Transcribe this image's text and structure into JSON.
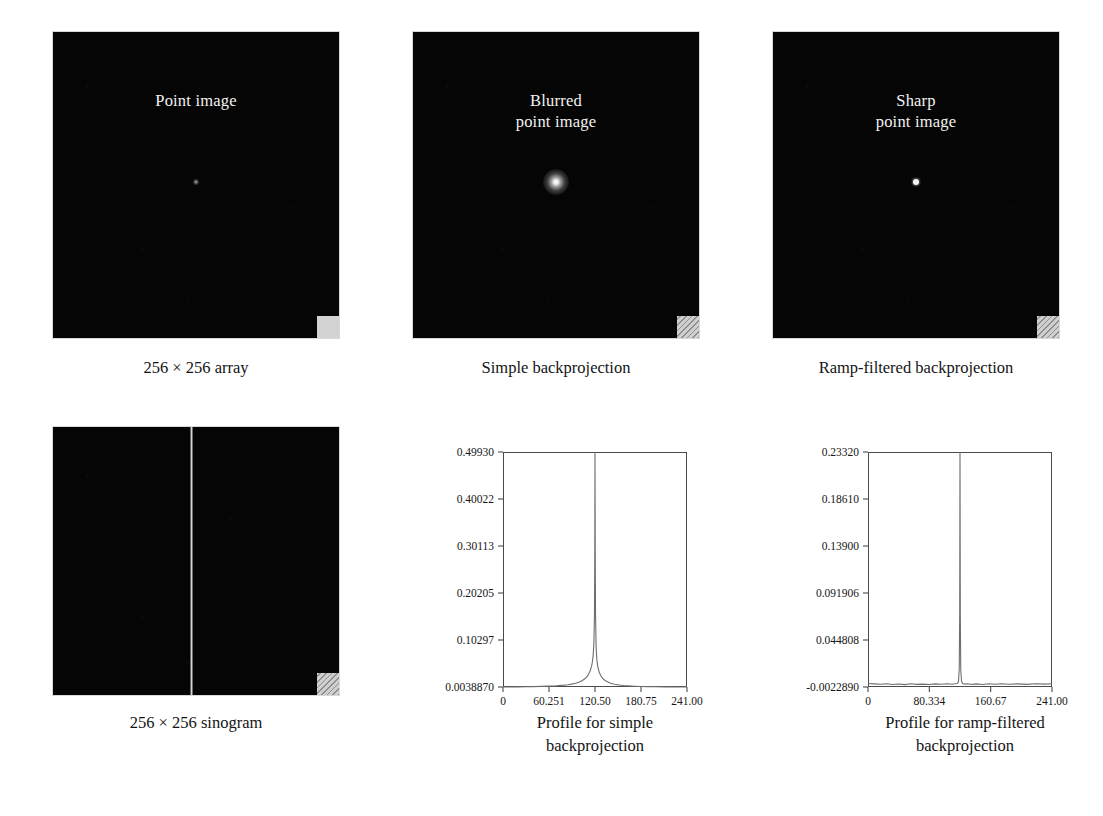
{
  "figure": {
    "panels": [
      {
        "id": "point-image",
        "overlay_title": "Point image",
        "caption": "256 × 256 array",
        "corner_marker": "solid-gray-square",
        "spot": "faint-point"
      },
      {
        "id": "blurred-point-image",
        "overlay_title": "Blurred\npoint image",
        "overlay_line1": "Blurred",
        "overlay_line2": "point image",
        "caption": "Simple backprojection",
        "corner_marker": "hatched-square",
        "spot": "blurred-point"
      },
      {
        "id": "sharp-point-image",
        "overlay_title": "Sharp\npoint image",
        "overlay_line1": "Sharp",
        "overlay_line2": "point image",
        "caption": "Ramp-filtered backprojection",
        "corner_marker": "hatched-square",
        "spot": "sharp-point"
      },
      {
        "id": "sinogram",
        "overlay_title": "",
        "caption": "256 × 256 sinogram",
        "corner_marker": "hatched-square",
        "spot": "vertical-line"
      }
    ],
    "captions": {
      "bottom_left": "256 × 256 sinogram",
      "bottom_middle_line1": "Profile for simple",
      "bottom_middle_line2": "backprojection",
      "bottom_right_line1": "Profile for ramp-filtered",
      "bottom_right_line2": "backprojection"
    },
    "colors": {
      "panel_background": "#050505",
      "overlay_text": "#f2f2f2",
      "plot_line": "#6e6e6e",
      "frame": "#4a4a4a",
      "page_background": "#ffffff",
      "corner_marker": "#d2d2d2"
    }
  },
  "chart_data": [
    {
      "id": "profile-simple-backprojection",
      "type": "line",
      "title": "Profile for simple backprojection",
      "title_line1": "Profile for simple",
      "title_line2": "backprojection",
      "xlabel": "",
      "ylabel": "",
      "xlim": [
        0,
        241.0
      ],
      "ylim": [
        0.003887,
        0.4993
      ],
      "grid": false,
      "legend": "none",
      "xticks": [
        0,
        60.251,
        120.5,
        180.75,
        241.0
      ],
      "xticklabels": [
        "0",
        "60.251",
        "120.50",
        "180.75",
        "241.00"
      ],
      "yticks": [
        0.003887,
        0.10297,
        0.20205,
        0.30113,
        0.40022,
        0.4993
      ],
      "yticklabels": [
        "0.0038870",
        "0.10297",
        "0.20205",
        "0.30113",
        "0.40022",
        "0.49930"
      ],
      "peak_center": 120.5,
      "peak_value": 0.4993,
      "baseline": 0.003887,
      "description": "Sharp central spike with broad 1/r tails typical of unfiltered backprojection blur",
      "x": [
        0,
        10,
        20,
        30,
        40,
        50,
        60,
        70,
        80,
        85,
        90,
        95,
        100,
        104,
        108,
        111,
        114,
        116,
        117,
        118,
        119,
        119.8,
        120.2,
        120.5,
        120.8,
        121.2,
        122,
        123,
        124,
        126,
        129,
        132,
        136,
        141,
        146,
        152,
        158,
        165,
        172,
        180,
        190,
        200,
        212,
        225,
        235,
        241
      ],
      "y": [
        0.0039,
        0.004,
        0.0042,
        0.0044,
        0.0047,
        0.0051,
        0.0057,
        0.0065,
        0.0078,
        0.0087,
        0.01,
        0.0118,
        0.0145,
        0.0175,
        0.0222,
        0.0278,
        0.0372,
        0.0478,
        0.056,
        0.069,
        0.094,
        0.156,
        0.288,
        0.4993,
        0.29,
        0.157,
        0.086,
        0.061,
        0.048,
        0.035,
        0.0252,
        0.0196,
        0.0152,
        0.0118,
        0.0098,
        0.0082,
        0.0071,
        0.0062,
        0.0056,
        0.005,
        0.0046,
        0.0043,
        0.0041,
        0.004,
        0.0039,
        0.0039
      ]
    },
    {
      "id": "profile-ramp-filtered-backprojection",
      "type": "line",
      "title": "Profile for ramp-filtered backprojection",
      "title_line1": "Profile for ramp-filtered",
      "title_line2": "backprojection",
      "xlabel": "",
      "ylabel": "",
      "xlim": [
        0,
        241.0
      ],
      "ylim": [
        -0.002289,
        0.2332
      ],
      "grid": false,
      "legend": "none",
      "xticks": [
        0,
        80.334,
        160.67,
        241.0
      ],
      "xticklabels": [
        "0",
        "80.334",
        "160.67",
        "241.00"
      ],
      "yticks": [
        -0.002289,
        0.044808,
        0.091906,
        0.139,
        0.1861,
        0.2332
      ],
      "yticklabels": [
        "-0.0022890",
        "0.044808",
        "0.091906",
        "0.13900",
        "0.18610",
        "0.23320"
      ],
      "peak_center": 120.5,
      "peak_value": 0.2332,
      "baseline": -0.002289,
      "description": "Very narrow impulse at center on a nearly flat noisy baseline",
      "x": [
        0,
        8,
        16,
        24,
        32,
        40,
        48,
        56,
        64,
        72,
        80,
        88,
        96,
        104,
        110,
        114,
        117,
        118.5,
        119.5,
        120.1,
        120.5,
        120.9,
        121.5,
        122.5,
        124,
        127,
        131,
        136,
        142,
        150,
        158,
        166,
        175,
        185,
        196,
        208,
        220,
        232,
        241
      ],
      "y": [
        0.0012,
        0.0008,
        0.0004,
        0.001,
        0.0002,
        0.0007,
        0.0001,
        0.0009,
        0.0003,
        0.0006,
        0.0002,
        0.0008,
        0.0004,
        0.001,
        0.0005,
        0.0009,
        0.0012,
        0.003,
        0.016,
        0.07,
        0.2332,
        0.069,
        0.015,
        0.0035,
        0.0012,
        0.0006,
        0.001,
        0.0003,
        0.0008,
        0.0002,
        0.0009,
        0.0004,
        0.001,
        0.0005,
        0.0008,
        0.0003,
        0.0009,
        0.0006,
        0.001
      ]
    }
  ]
}
